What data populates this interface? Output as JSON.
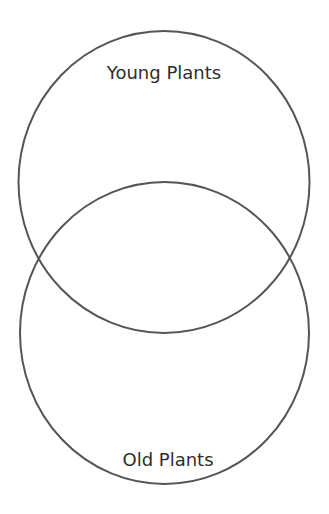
{
  "diagram": {
    "type": "venn",
    "stroke_color": "#555555",
    "sets": [
      {
        "label": "Young Plants"
      },
      {
        "label": "Old Plants"
      }
    ]
  }
}
